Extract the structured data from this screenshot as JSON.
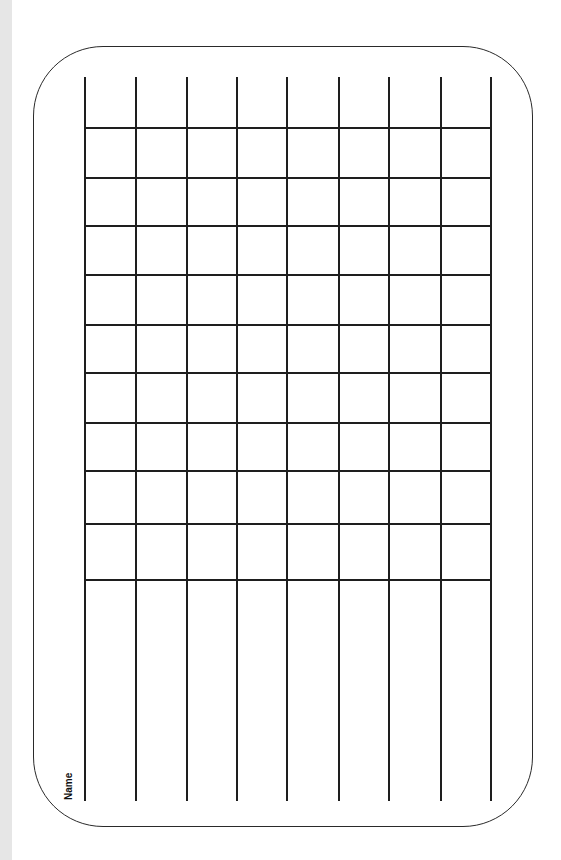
{
  "document": {
    "type": "blank-grid-worksheet",
    "name_label": "Name",
    "grid": {
      "columns": 8,
      "vertical_lines_x": [
        84,
        135,
        186,
        236,
        286,
        338,
        388,
        440,
        490
      ],
      "horizontal_lines_y": [
        127,
        177,
        225,
        274,
        324,
        372,
        422,
        470,
        523,
        579
      ],
      "line_color": "#1e1e1e"
    },
    "frame": {
      "border_color": "#2a2a2a",
      "corner_radius": 70
    },
    "gutter_color": "#e6e6e6"
  }
}
